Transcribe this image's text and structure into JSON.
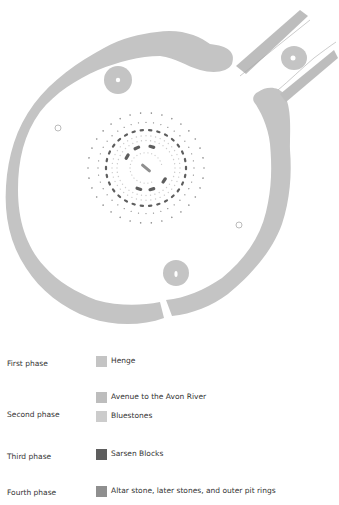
{
  "legend": {
    "phases": [
      {
        "label": "First phase",
        "items": [
          {
            "label": "Henge",
            "color": "#c4c4c4"
          }
        ]
      },
      {
        "label": "Second phase",
        "items": [
          {
            "label": "Avenue to the Avon River",
            "color": "#bdbdbd"
          },
          {
            "label": "Bluestones",
            "color": "#cccccc"
          }
        ]
      },
      {
        "label": "Third phase",
        "items": [
          {
            "label": "Sarsen Blocks",
            "color": "#5e5e5e"
          }
        ]
      },
      {
        "label": "Fourth phase",
        "items": [
          {
            "label": "Altar stone, later stones, and outer pit rings",
            "color": "#8f8f8f"
          }
        ]
      }
    ]
  },
  "colors": {
    "henge": "#c4c4c4",
    "avenue": "#bdbdbd",
    "bluestones": "#cccccc",
    "sarsen": "#5e5e5e",
    "fourth": "#8f8f8f"
  }
}
